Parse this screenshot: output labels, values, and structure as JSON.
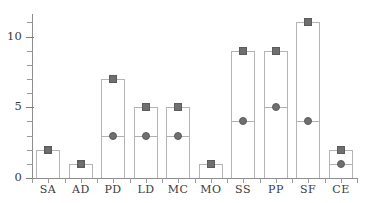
{
  "chart_data": {
    "type": "bar",
    "title": "",
    "subtitle": "",
    "xlabel": "",
    "ylabel": "",
    "categories": [
      "SA",
      "AD",
      "PD",
      "LD",
      "MC",
      "MO",
      "SS",
      "PP",
      "SF",
      "CE"
    ],
    "values": [
      2,
      1,
      7,
      5,
      5,
      1,
      9,
      9,
      11,
      2
    ],
    "series": [
      {
        "name": "bar-height",
        "marker": "square",
        "values": [
          2,
          1,
          7,
          5,
          5,
          1,
          9,
          9,
          11,
          2
        ]
      },
      {
        "name": "inner-marker",
        "marker": "circle",
        "values": [
          2,
          1,
          3,
          3,
          3,
          null,
          4,
          5,
          4,
          1
        ]
      }
    ],
    "ylim": [
      0,
      11.6
    ],
    "xlim": [
      0,
      10
    ],
    "y_major_ticks": [
      0,
      5,
      10
    ],
    "y_major_tick_labels": [
      "0",
      "5",
      "10"
    ],
    "y_minor_ticks": [
      1,
      2,
      3,
      4,
      6,
      7,
      8,
      9,
      11
    ],
    "grid": false,
    "legend": null,
    "legend_position": "none",
    "colors": {
      "bar_fill": "#ffffff",
      "bar_stroke": "#b4b4b4",
      "marker": "#6f6f6f",
      "marker_stroke": "#5c5c5c",
      "axis": "#8d8d8d",
      "tick": "#9a9a9a",
      "text": "#3a3a3a",
      "background": "#ffffff"
    },
    "annotations": []
  },
  "axes": {
    "y_labels": [
      "10",
      "5",
      "0"
    ],
    "x_labels": [
      "SA",
      "AD",
      "PD",
      "LD",
      "MC",
      "MO",
      "SS",
      "PP",
      "SF",
      "CE"
    ]
  }
}
